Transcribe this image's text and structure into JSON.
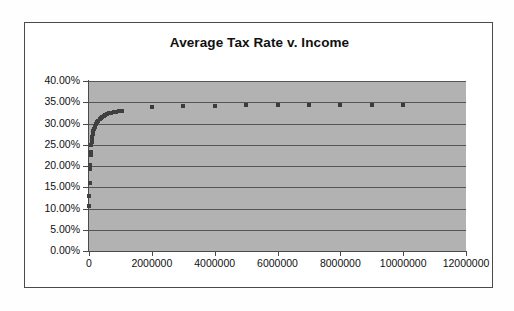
{
  "chart_data": {
    "type": "scatter",
    "title": "Average Tax Rate v. Income",
    "xlabel": "",
    "ylabel": "",
    "xlim": [
      0,
      12000000
    ],
    "ylim": [
      0,
      0.4
    ],
    "grid": true,
    "legend": "none",
    "plot_background": "#b2b2b2",
    "marker_color": "#3b3b3b",
    "marker_shape": "square",
    "y_tick_labels": [
      "0.00%",
      "5.00%",
      "10.00%",
      "15.00%",
      "20.00%",
      "25.00%",
      "30.00%",
      "35.00%",
      "40.00%"
    ],
    "y_tick_values": [
      0,
      5,
      10,
      15,
      20,
      25,
      30,
      35,
      40
    ],
    "x_tick_labels": [
      "0",
      "2000000",
      "4000000",
      "6000000",
      "8000000",
      "10000000",
      "12000000"
    ],
    "x_tick_values": [
      0,
      2000000,
      4000000,
      6000000,
      8000000,
      10000000,
      12000000
    ],
    "series": [
      {
        "name": "Average Tax Rate",
        "x": [
          5000,
          12000,
          20000,
          30000,
          40000,
          50000,
          60000,
          70000,
          80000,
          90000,
          100000,
          120000,
          140000,
          160000,
          180000,
          200000,
          230000,
          260000,
          300000,
          340000,
          380000,
          420000,
          470000,
          520000,
          580000,
          640000,
          700000,
          780000,
          860000,
          950000,
          1050000,
          2000000,
          3000000,
          4000000,
          5000000,
          6000000,
          7000000,
          8000000,
          9000000,
          10000000
        ],
        "y": [
          10.6,
          13.0,
          16.1,
          19.3,
          20.2,
          22.6,
          23.3,
          25.0,
          25.6,
          26.3,
          26.9,
          27.6,
          28.2,
          28.7,
          29.1,
          29.5,
          29.9,
          30.3,
          30.7,
          31.0,
          31.3,
          31.5,
          31.8,
          32.0,
          32.2,
          32.4,
          32.5,
          32.7,
          32.8,
          32.9,
          33.0,
          33.8,
          34.1,
          34.1,
          34.3,
          34.3,
          34.3,
          34.4,
          34.4,
          34.4
        ]
      }
    ]
  }
}
